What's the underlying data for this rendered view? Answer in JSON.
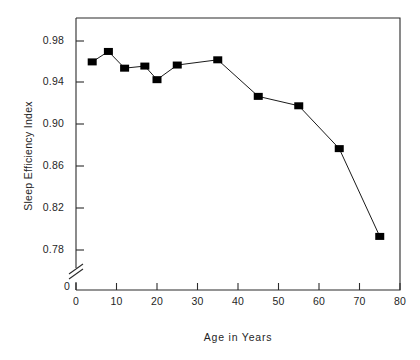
{
  "chart_data": {
    "type": "line",
    "title": "",
    "xlabel": "Age in Years",
    "ylabel": "Sleep Efficiency Index",
    "xlim": [
      0,
      80
    ],
    "ylim": [
      0.76,
      0.995
    ],
    "grid": false,
    "legend": null,
    "axis_break": {
      "axis": "y",
      "label_below_break": "0",
      "note": "y-axis broken between 0 and 0.78"
    },
    "xticks": [
      0,
      10,
      20,
      30,
      40,
      50,
      60,
      70,
      80
    ],
    "xtick_labels": [
      "0",
      "10",
      "20",
      "30",
      "40",
      "50",
      "60",
      "70",
      "80"
    ],
    "yticks": [
      0.78,
      0.82,
      0.86,
      0.9,
      0.94,
      0.98
    ],
    "ytick_labels": [
      "0.78",
      "0.82",
      "0.86",
      "0.90",
      "0.94",
      "0.98"
    ],
    "series": [
      {
        "name": "Sleep Efficiency Index",
        "marker": "square",
        "marker_color": "#000000",
        "line_color": "#000000",
        "x": [
          4,
          8,
          12,
          17,
          20,
          25,
          35,
          45,
          55,
          65,
          75
        ],
        "y": [
          0.96,
          0.97,
          0.954,
          0.956,
          0.943,
          0.957,
          0.962,
          0.927,
          0.918,
          0.877,
          0.793
        ]
      }
    ]
  },
  "axes": {
    "ylabel_text": "Sleep Efficiency Index",
    "xlabel_text": "Age in Years",
    "origin_label": "0"
  }
}
